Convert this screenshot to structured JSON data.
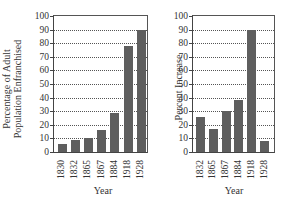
{
  "chart_data": [
    {
      "type": "bar",
      "title": "",
      "xlabel": "Year",
      "ylabel": "Percentage of Adult Population Enfranchised",
      "ylabel_lines": [
        "Percentage of Adult",
        "Population Enfranchised"
      ],
      "categories": [
        "1830",
        "1832",
        "1865",
        "1867",
        "1884",
        "1918",
        "1928"
      ],
      "values": [
        6,
        9,
        10,
        16,
        29,
        78,
        90
      ],
      "ylim": [
        0,
        100
      ],
      "yticks": [
        0,
        10,
        20,
        30,
        40,
        50,
        60,
        70,
        80,
        90,
        100
      ],
      "grid": "horizontal dotted",
      "legend": null
    },
    {
      "type": "bar",
      "title": "",
      "xlabel": "Year",
      "ylabel": "Percent Increase",
      "categories": [
        "1832",
        "1865",
        "1867",
        "1884",
        "1918",
        "1928"
      ],
      "values": [
        26,
        17,
        30,
        38,
        90,
        8
      ],
      "ylim": [
        0,
        100
      ],
      "yticks": [
        0,
        10,
        20,
        30,
        40,
        50,
        60,
        70,
        80,
        90,
        100
      ],
      "grid": "horizontal dotted",
      "legend": null
    }
  ],
  "colors": {
    "bar": "#5e5e5e",
    "axis": "#444444",
    "grid": "#555555"
  }
}
